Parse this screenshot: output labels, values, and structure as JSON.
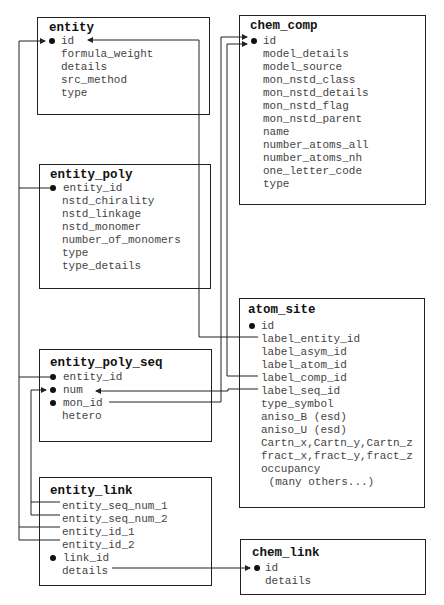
{
  "tables": {
    "entity": {
      "title": "entity",
      "fields": [
        "id",
        "formula_weight",
        "details",
        "src_method",
        "type"
      ]
    },
    "chem_comp": {
      "title": "chem_comp",
      "fields": [
        "id",
        "model_details",
        "model_source",
        "mon_nstd_class",
        "mon_nstd_details",
        "mon_nstd_flag",
        "mon_nstd_parent",
        "name",
        "number_atoms_all",
        "number_atoms_nh",
        "one_letter_code",
        "type"
      ]
    },
    "entity_poly": {
      "title": "entity_poly",
      "fields": [
        "entity_id",
        "nstd_chirality",
        "nstd_linkage",
        "nstd_monomer",
        "number_of_monomers",
        "type",
        "type_details"
      ]
    },
    "atom_site": {
      "title": "atom_site",
      "fields": [
        "id",
        "label_entity_id",
        "label_asym_id",
        "label_atom_id",
        "label_comp_id",
        "label_seq_id",
        "type_symbol",
        "aniso_B (esd)",
        "aniso_U (esd)",
        "Cartn_x,Cartn_y,Cartn_z",
        "fract_x,fract_y,fract_z",
        "occupancy",
        " (many others...)"
      ]
    },
    "entity_poly_seq": {
      "title": "entity_poly_seq",
      "fields": [
        "entity_id",
        "num",
        "mon_id",
        "hetero"
      ]
    },
    "entity_link": {
      "title": "entity_link",
      "fields": [
        "entity_seq_num_1",
        "entity_seq_num_2",
        "entity_id_1",
        "entity_id_2",
        "link_id",
        "details"
      ]
    },
    "chem_link": {
      "title": "chem_link",
      "fields": [
        "id",
        "details"
      ]
    }
  },
  "colors": {
    "line": "#222222",
    "text": "#444444",
    "title": "#111111"
  }
}
